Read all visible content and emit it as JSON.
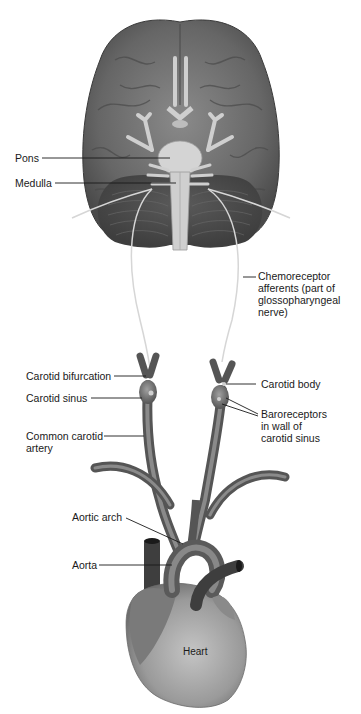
{
  "figure": {
    "colors": {
      "background": "#ffffff",
      "brain": "#6e6e6e",
      "brain_dark": "#4a4a4a",
      "brainstem": "#cfcfcf",
      "nerve": "#d8d8d8",
      "artery": "#6a6a6a",
      "heart": "#9a9a9a",
      "leader_line": "#1a1a1a",
      "text": "#1a1a1a"
    },
    "labels": {
      "pons": "Pons",
      "medulla": "Medulla",
      "chemoreceptor": "Chemoreceptor\nafferents (part of\nglossopharyngeal\nnerve)",
      "carotid_bifurcation": "Carotid bifurcation",
      "carotid_sinus": "Carotid sinus",
      "common_carotid": "Common carotid\nartery",
      "carotid_body": "Carotid body",
      "baroreceptors": "Baroreceptors\nin wall of\ncarotid sinus",
      "aortic_arch": "Aortic arch",
      "aorta": "Aorta",
      "heart": "Heart"
    }
  }
}
